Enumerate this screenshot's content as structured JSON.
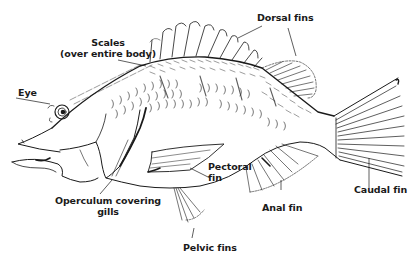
{
  "diagram": {
    "ink_color": "#1a1a1a",
    "background": "#ffffff",
    "labels": {
      "dorsal_fins": "Dorsal fins",
      "scales_line1": "Scales",
      "scales_line2": "(over entire body)",
      "eye": "Eye",
      "pectoral_fin_line1": "Pectoral",
      "pectoral_fin_line2": "fin",
      "caudal_fin": "Caudal fin",
      "operculum_line1": "Operculum covering",
      "operculum_line2": "gills",
      "anal_fin": "Anal fin",
      "pelvic_fins": "Pelvic fins"
    }
  }
}
